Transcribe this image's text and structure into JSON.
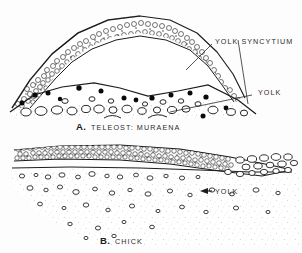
{
  "figure": {
    "background_color": "#fdfdfd",
    "ink_color": "#1c1c1c",
    "label_color": "#2b2b2b",
    "panels": [
      {
        "id": "panel-a",
        "caption_letter": "A.",
        "caption_text": "TELEOST: MURAENA",
        "subject": "teleost embryo section",
        "labels": [
          {
            "name": "yolk-syncytium",
            "text": "YOLK SYNCYTIUM"
          },
          {
            "name": "yolk",
            "text": "YOLK"
          }
        ]
      },
      {
        "id": "panel-b",
        "caption_letter": "B.",
        "caption_text": "CHICK",
        "subject": "chick embryo section",
        "labels": [
          {
            "name": "yolk",
            "text": "YOLK"
          }
        ]
      }
    ]
  },
  "panel_a": {
    "label_syncytium": "YOLK SYNCYTIUM",
    "label_yolk": "YOLK",
    "caption_letter": "A.",
    "caption_text": "TELEOST: MURAENA"
  },
  "panel_b": {
    "label_yolk": "YOLK",
    "caption_letter": "B.",
    "caption_text": "CHICK"
  }
}
